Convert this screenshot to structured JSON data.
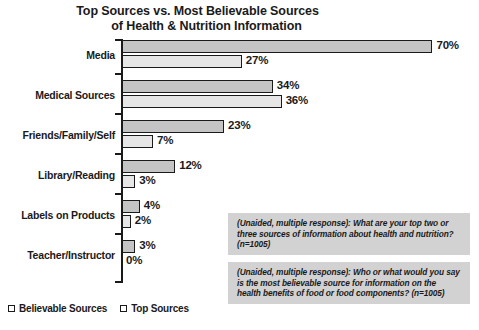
{
  "chart_data": {
    "type": "bar",
    "title": "Top Sources vs. Most Believable Sources of Health & Nutrition Information",
    "title_line1": "Top Sources vs. Most Believable Sources",
    "title_line2": "of Health & Nutrition Information",
    "orientation": "horizontal",
    "grid": false,
    "xlabel": "",
    "ylabel": "",
    "xlim": [
      0,
      70
    ],
    "legend_position": "bottom-left",
    "categories": [
      "Media",
      "Medical Sources",
      "Friends/Family/Self",
      "Library/Reading",
      "Labels on Products",
      "Teacher/Instructor"
    ],
    "series": [
      {
        "name": "Believable Sources",
        "color": "#c4c4c4",
        "values": [
          70,
          34,
          23,
          12,
          4,
          3
        ],
        "labels": [
          "70%",
          "34%",
          "23%",
          "12%",
          "4%",
          "3%"
        ]
      },
      {
        "name": "Top Sources",
        "color": "#e6e6e6",
        "values": [
          27,
          36,
          7,
          3,
          2,
          0
        ],
        "labels": [
          "27%",
          "36%",
          "7%",
          "3%",
          "2%",
          "0%"
        ]
      }
    ],
    "annotations": [
      "(Unaided, multiple response): What are your top two or three sources of information about health and nutrition? (n=1005)",
      "(Unaided, multiple response): Who or what would you say is the most believable source for information on the health benefits of food or food components? (n=1005)"
    ]
  },
  "legend": {
    "items": [
      {
        "label": "Believable Sources"
      },
      {
        "label": "Top Sources"
      }
    ]
  }
}
